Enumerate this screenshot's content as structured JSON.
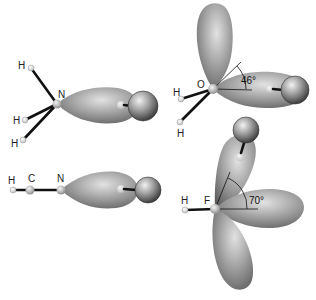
{
  "diagram": {
    "panels": [
      {
        "id": "ammonia",
        "atoms": {
          "center": "N",
          "substituents": [
            "H",
            "H",
            "H"
          ]
        },
        "labels": {
          "center": "N",
          "h1": "H",
          "h2": "H",
          "h3": "H"
        }
      },
      {
        "id": "water",
        "atoms": {
          "center": "O",
          "substituents": [
            "H",
            "H"
          ]
        },
        "labels": {
          "center": "O",
          "h1": "H",
          "h2": "H"
        },
        "angle_label": "46°"
      },
      {
        "id": "hydrogen-cyanide",
        "atoms": {
          "chain": [
            "H",
            "C",
            "N"
          ]
        },
        "labels": {
          "h": "H",
          "c": "C",
          "n": "N"
        }
      },
      {
        "id": "hydrogen-fluoride",
        "atoms": {
          "center": "F",
          "substituents": [
            "H"
          ]
        },
        "labels": {
          "center": "F",
          "h": "H"
        },
        "angle_label": "70°"
      }
    ],
    "colors": {
      "lobe_light": "#d8d8d8",
      "lobe_dark": "#6a6a6a",
      "sphere_light": "#e6e6e6",
      "sphere_dark": "#3a3a3a",
      "bond": "#111111"
    }
  }
}
